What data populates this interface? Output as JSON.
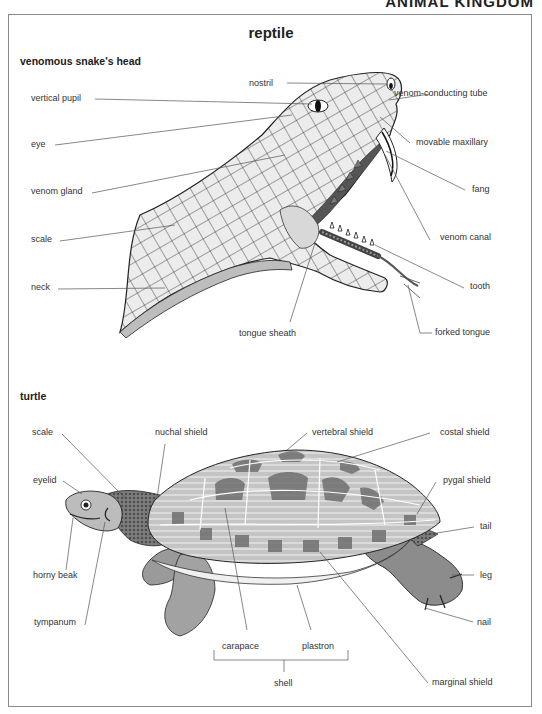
{
  "header": {
    "running_title": "ANIMAL KINGDOM"
  },
  "page": {
    "title": "reptile"
  },
  "snake": {
    "heading": "venomous snake's head",
    "labels": {
      "nostril": "nostril",
      "vertical_pupil": "vertical pupil",
      "venom_conducting_tube": "venom-conducting tube",
      "eye": "eye",
      "movable_maxillary": "movable maxillary",
      "venom_gland": "venom gland",
      "fang": "fang",
      "scale": "scale",
      "venom_canal": "venom canal",
      "neck": "neck",
      "tooth": "tooth",
      "tongue_sheath": "tongue sheath",
      "forked_tongue": "forked tongue"
    }
  },
  "turtle": {
    "heading": "turtle",
    "labels": {
      "scale": "scale",
      "nuchal_shield": "nuchal shield",
      "vertebral_shield": "vertebral shield",
      "costal_shield": "costal shield",
      "eyelid": "eyelid",
      "pygal_shield": "pygal shield",
      "tail": "tail",
      "horny_beak": "horny beak",
      "leg": "leg",
      "tympanum": "tympanum",
      "nail": "nail",
      "carapace": "carapace",
      "plastron": "plastron",
      "shell": "shell",
      "marginal_shield": "marginal shield"
    }
  },
  "colors": {
    "frame": "#8a8a8a",
    "line": "#555555",
    "scale_fill": "#e6e6e6",
    "shell_fill": "#bdbdbd",
    "shell_dark": "#6f6f6f",
    "skin": "#8c8c8c"
  }
}
